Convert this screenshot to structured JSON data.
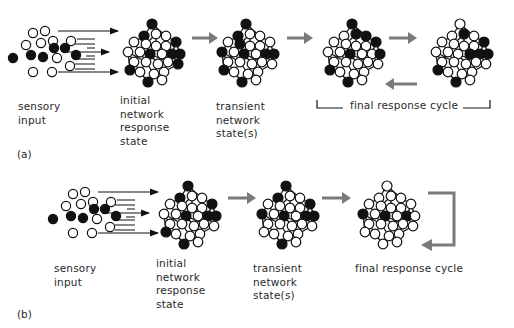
{
  "colors": {
    "ink": "#111111",
    "arrow_gray": "#7a7a7a",
    "text": "#2a2a2a"
  },
  "panel_a": {
    "tag": "(a)",
    "labels": {
      "sensory": "sensory\ninput",
      "initial": "initial\nnetwork\nresponse\nstate",
      "transient": "transient\nnetwork\nstate(s)",
      "final": "final response cycle"
    }
  },
  "panel_b": {
    "tag": "(b)",
    "labels": {
      "sensory": "sensory\ninput",
      "initial": "initial\nnetwork\nresponse\nstate",
      "transient": "transient\nnetwork\nstate(s)",
      "final": "final response cycle"
    }
  },
  "network": {
    "nodes": [
      [
        0,
        0
      ],
      [
        -8,
        12
      ],
      [
        4,
        10
      ],
      [
        14,
        12
      ],
      [
        -18,
        18
      ],
      [
        -6,
        20
      ],
      [
        4,
        22
      ],
      [
        14,
        22
      ],
      [
        24,
        18
      ],
      [
        -24,
        28
      ],
      [
        -12,
        28
      ],
      [
        -2,
        30
      ],
      [
        10,
        30
      ],
      [
        20,
        30
      ],
      [
        28,
        30
      ],
      [
        -18,
        38
      ],
      [
        -6,
        38
      ],
      [
        6,
        40
      ],
      [
        16,
        38
      ],
      [
        26,
        40
      ],
      [
        -12,
        48
      ],
      [
        2,
        50
      ],
      [
        12,
        48
      ],
      [
        -4,
        58
      ],
      [
        10,
        56
      ],
      [
        -22,
        46
      ]
    ],
    "edges": [
      [
        0,
        1
      ],
      [
        0,
        2
      ],
      [
        0,
        3
      ],
      [
        1,
        4
      ],
      [
        1,
        5
      ],
      [
        2,
        5
      ],
      [
        2,
        6
      ],
      [
        3,
        7
      ],
      [
        3,
        8
      ],
      [
        4,
        9
      ],
      [
        4,
        10
      ],
      [
        5,
        10
      ],
      [
        5,
        11
      ],
      [
        6,
        11
      ],
      [
        6,
        12
      ],
      [
        7,
        12
      ],
      [
        7,
        13
      ],
      [
        8,
        13
      ],
      [
        8,
        14
      ],
      [
        9,
        15
      ],
      [
        10,
        15
      ],
      [
        10,
        16
      ],
      [
        11,
        16
      ],
      [
        11,
        17
      ],
      [
        12,
        17
      ],
      [
        12,
        18
      ],
      [
        13,
        18
      ],
      [
        13,
        19
      ],
      [
        14,
        19
      ],
      [
        15,
        20
      ],
      [
        16,
        20
      ],
      [
        16,
        21
      ],
      [
        17,
        21
      ],
      [
        17,
        22
      ],
      [
        18,
        22
      ],
      [
        19,
        22
      ],
      [
        20,
        23
      ],
      [
        21,
        23
      ],
      [
        21,
        24
      ],
      [
        22,
        24
      ],
      [
        9,
        25
      ],
      [
        25,
        20
      ],
      [
        15,
        25
      ],
      [
        9,
        16
      ],
      [
        11,
        18
      ]
    ]
  },
  "states": {
    "a_initial": [
      0,
      1,
      8,
      11,
      13,
      14,
      25,
      19,
      23
    ],
    "a_transient": [
      0,
      1,
      9,
      11,
      13,
      14,
      25,
      23,
      5
    ],
    "a_final1": [
      0,
      2,
      3,
      8,
      11,
      14,
      25,
      23
    ],
    "a_final2": [
      2,
      8,
      12,
      13,
      14,
      25,
      23
    ],
    "b_initial": [
      0,
      1,
      8,
      11,
      13,
      14,
      25,
      23
    ],
    "b_transient": [
      0,
      1,
      8,
      9,
      11,
      13,
      14,
      23
    ],
    "b_final": [
      9,
      11,
      13,
      28
    ]
  }
}
